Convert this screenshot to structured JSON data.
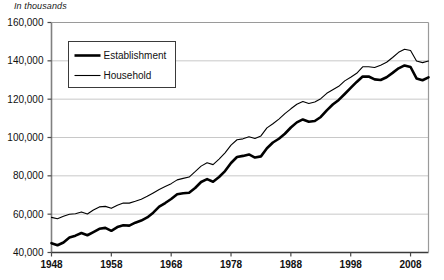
{
  "chart_data": {
    "type": "line",
    "title": "",
    "subtitle": "",
    "ylabel": "In thousands",
    "xlabel": "",
    "grid": true,
    "legend_position": "top-left-inside",
    "xlim": [
      1948,
      2011
    ],
    "ylim": [
      40000,
      160000
    ],
    "ytick_labels": [
      "160,000",
      "140,000",
      "120,000",
      "100,000",
      "80,000",
      "60,000",
      "40,000"
    ],
    "ytick_values": [
      160000,
      140000,
      120000,
      100000,
      80000,
      60000,
      40000
    ],
    "xtick_labels": [
      "1948",
      "1958",
      "1968",
      "1978",
      "1988",
      "1998",
      "2008"
    ],
    "xtick_values": [
      1948,
      1958,
      1968,
      1978,
      1988,
      1998,
      2008
    ],
    "x": [
      1948,
      1949,
      1950,
      1951,
      1952,
      1953,
      1954,
      1955,
      1956,
      1957,
      1958,
      1959,
      1960,
      1961,
      1962,
      1963,
      1964,
      1965,
      1966,
      1967,
      1968,
      1969,
      1970,
      1971,
      1972,
      1973,
      1974,
      1975,
      1976,
      1977,
      1978,
      1979,
      1980,
      1981,
      1982,
      1983,
      1984,
      1985,
      1986,
      1987,
      1988,
      1989,
      1990,
      1991,
      1992,
      1993,
      1994,
      1995,
      1996,
      1997,
      1998,
      1999,
      2000,
      2001,
      2002,
      2003,
      2004,
      2005,
      2006,
      2007,
      2008,
      2009,
      2010,
      2011
    ],
    "series": [
      {
        "name": "Establishment",
        "style": "thick",
        "color": "#000000",
        "values": [
          44866,
          43754,
          45197,
          47819,
          48793,
          50202,
          48990,
          50641,
          52369,
          52853,
          51324,
          53268,
          54189,
          53999,
          55549,
          56653,
          58283,
          60765,
          63901,
          65803,
          67897,
          70384,
          70880,
          71214,
          73675,
          76790,
          78265,
          76945,
          79382,
          82471,
          86697,
          89823,
          90406,
          91152,
          89544,
          90152,
          94408,
          97387,
          99344,
          101958,
          105210,
          107895,
          109419,
          108256,
          108604,
          110713,
          114163,
          117191,
          119608,
          122690,
          125865,
          128993,
          131785,
          131826,
          130341,
          129999,
          131435,
          133703,
          136086,
          137598,
          136790,
          130807,
          129874,
          131359
        ]
      },
      {
        "name": "Household",
        "style": "thin",
        "color": "#000000",
        "values": [
          58343,
          57651,
          58918,
          59961,
          60250,
          61179,
          60109,
          62170,
          63799,
          64071,
          63036,
          64630,
          65778,
          65746,
          66702,
          67762,
          69305,
          71088,
          72895,
          74372,
          75920,
          77902,
          78678,
          79367,
          82153,
          85064,
          86794,
          85846,
          88752,
          92017,
          96048,
          98824,
          99303,
          100397,
          99526,
          100834,
          105005,
          107150,
          109597,
          112440,
          114968,
          117342,
          118793,
          117718,
          118492,
          120259,
          123060,
          124900,
          126708,
          129558,
          131463,
          133488,
          136891,
          136933,
          136485,
          137736,
          139252,
          141730,
          144427,
          146047,
          145362,
          139877,
          139064,
          139869
        ]
      }
    ],
    "annotations": []
  },
  "legend": {
    "items": [
      {
        "label": "Establishment",
        "style": "thick"
      },
      {
        "label": "Household",
        "style": "thin"
      }
    ]
  }
}
